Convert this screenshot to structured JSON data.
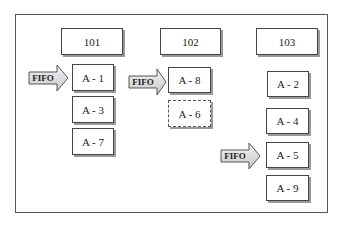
{
  "columns": [
    {
      "id": "101",
      "label": "101",
      "items": [
        "A - 1",
        "A - 3",
        "A - 7"
      ],
      "fifo_at": 0
    },
    {
      "id": "102",
      "label": "102",
      "items": [
        "A - 8",
        "A - 6"
      ],
      "fifo_at": 0,
      "dashed_item": "A - 6"
    },
    {
      "id": "103",
      "label": "103",
      "items": [
        "A - 2",
        "A - 4",
        "A - 5",
        "A - 9"
      ],
      "fifo_at": 2
    }
  ],
  "arrows": [
    {
      "label": "FIFO",
      "points_to": "A - 1"
    },
    {
      "label": "FIFO",
      "points_to": "A - 8"
    },
    {
      "label": "FIFO",
      "points_to": "A - 5"
    }
  ],
  "colors": {
    "border": "#444444",
    "shadow": "#9a9a9a",
    "arrow_fill": "#e4e4e4"
  }
}
